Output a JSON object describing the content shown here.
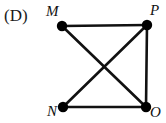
{
  "figure": {
    "choice_label": "(D)",
    "background_color": "#ffffff",
    "stroke_color": "#111111",
    "vertex_fill_color": "#000000",
    "canvas": {
      "width": 166,
      "height": 123
    }
  },
  "graph": {
    "type": "undirected-graph-diagram",
    "vertices": [
      {
        "id": "M",
        "label": "M",
        "x": 62,
        "y": 26,
        "radius": 5.2,
        "label_position": "upper-left"
      },
      {
        "id": "P",
        "label": "P",
        "x": 147,
        "y": 25,
        "radius": 5.2,
        "label_position": "upper-right"
      },
      {
        "id": "N",
        "label": "N",
        "x": 63,
        "y": 107,
        "radius": 5.2,
        "label_position": "lower-left"
      },
      {
        "id": "O",
        "label": "O",
        "x": 146,
        "y": 107,
        "radius": 5.2,
        "label_position": "lower-right"
      }
    ],
    "edges": [
      {
        "from": "M",
        "to": "P",
        "name": "edge-M-P"
      },
      {
        "from": "P",
        "to": "O",
        "name": "edge-P-O"
      },
      {
        "from": "N",
        "to": "O",
        "name": "edge-N-O"
      },
      {
        "from": "M",
        "to": "O",
        "name": "edge-M-O"
      },
      {
        "from": "N",
        "to": "P",
        "name": "edge-N-P"
      }
    ],
    "missing_edges": [
      {
        "from": "M",
        "to": "N"
      }
    ],
    "edge_width": 2.6,
    "crossing_point": {
      "x": 105,
      "y": 66
    }
  }
}
